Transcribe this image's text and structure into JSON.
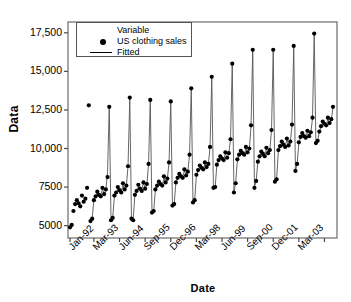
{
  "chart_data": {
    "type": "scatter",
    "title": "",
    "xlabel": "Date",
    "ylabel": "Data",
    "grid": false,
    "ylim": [
      4200,
      18200
    ],
    "yticks": [
      5000,
      7500,
      10000,
      12500,
      15000,
      17500
    ],
    "ytick_labels": [
      "5000",
      "7500",
      "10,000",
      "12,500",
      "15,000",
      "17,500"
    ],
    "xtick_labels": [
      "Jan-92",
      "Mar-93",
      "Jun-94",
      "Sep-95",
      "Dec-96",
      "Mar-98",
      "Jun-99",
      "Sep-00",
      "Dec-01",
      "Mar-03"
    ],
    "xtick_indices": [
      0,
      14,
      29,
      44,
      59,
      74,
      89,
      104,
      119,
      134
    ],
    "xtick_unlabeled_indices": [
      149
    ],
    "legend": {
      "position": "top-left-inside",
      "title": "Variable",
      "entries": [
        {
          "name": "US clothing sales",
          "marker": "filled-circle",
          "color": "#000000"
        },
        {
          "name": "Fitted",
          "marker": "line",
          "color": "#000000"
        }
      ]
    },
    "x_start": "Jan-92",
    "x_frequency": "monthly",
    "series": [
      {
        "name": "US clothing sales",
        "marker": "filled-circle",
        "color": "#000000",
        "values": [
          4889,
          5050,
          5950,
          6400,
          6650,
          6450,
          6250,
          6950,
          6550,
          6750,
          7450,
          12800,
          5300,
          5450,
          6650,
          6900,
          7200,
          7000,
          6900,
          7450,
          7050,
          7350,
          8150,
          12700,
          5350,
          5500,
          6950,
          7150,
          7500,
          7300,
          7150,
          7750,
          7350,
          7600,
          8850,
          13300,
          5450,
          5350,
          7000,
          7250,
          7650,
          7400,
          7250,
          7800,
          7400,
          7700,
          9000,
          13150,
          5850,
          5950,
          7350,
          7600,
          7850,
          7700,
          7600,
          8200,
          7800,
          8050,
          9100,
          13050,
          6300,
          6400,
          7800,
          8100,
          8350,
          8200,
          8100,
          8650,
          8250,
          8500,
          9600,
          13900,
          6500,
          6650,
          8300,
          8600,
          8900,
          8750,
          8650,
          9100,
          8800,
          9000,
          10100,
          14650,
          7450,
          7500,
          8950,
          9250,
          9500,
          9350,
          9250,
          9750,
          9400,
          9700,
          10600,
          15500,
          7150,
          7750,
          9300,
          9600,
          9850,
          9700,
          9600,
          10100,
          9750,
          10000,
          11500,
          16400,
          7450,
          7900,
          9150,
          9500,
          9800,
          9650,
          9500,
          10050,
          9700,
          9900,
          11200,
          16400,
          7850,
          8000,
          9900,
          10150,
          10450,
          10250,
          10100,
          10650,
          10200,
          10450,
          11550,
          16650,
          8550,
          9000,
          10400,
          10750,
          11000,
          10800,
          10700,
          11150,
          10800,
          11050,
          12000,
          17450,
          10350,
          10500,
          11100,
          11450,
          11750,
          11600,
          11500,
          12000,
          11650,
          11900,
          12700
        ]
      },
      {
        "name": "Fitted",
        "marker": "line",
        "color": "#000000",
        "values": [
          null,
          null,
          null,
          null,
          null,
          null,
          null,
          null,
          null,
          null,
          null,
          null,
          5300,
          5500,
          6700,
          6900,
          7150,
          7000,
          6900,
          7400,
          7050,
          7300,
          8500,
          12750,
          5400,
          5500,
          6900,
          7100,
          7400,
          7250,
          7150,
          7650,
          7300,
          7550,
          8900,
          13250,
          5400,
          5400,
          7000,
          7200,
          7550,
          7400,
          7300,
          7800,
          7400,
          7650,
          9000,
          13100,
          5900,
          5950,
          7300,
          7550,
          7800,
          7650,
          7550,
          8100,
          7750,
          8000,
          9100,
          13000,
          6300,
          6400,
          7800,
          8050,
          8350,
          8200,
          8100,
          8600,
          8250,
          8500,
          9600,
          13850,
          6550,
          6650,
          8250,
          8550,
          8850,
          8700,
          8600,
          9050,
          8750,
          8950,
          10100,
          14600,
          7400,
          7500,
          8950,
          9200,
          9500,
          9350,
          9250,
          9700,
          9400,
          9650,
          10600,
          15450,
          7200,
          7750,
          9250,
          9550,
          9800,
          9650,
          9550,
          10050,
          9700,
          9950,
          11450,
          16350,
          7500,
          7900,
          9150,
          9450,
          9750,
          9600,
          9500,
          10000,
          9700,
          9900,
          11200,
          16350,
          7850,
          8000,
          9850,
          10100,
          10400,
          10250,
          10100,
          10600,
          10200,
          10400,
          11500,
          16600,
          8550,
          9000,
          10350,
          10700,
          10950,
          10800,
          10700,
          11100,
          10800,
          11000,
          11950,
          17400,
          10300,
          10450,
          11100,
          11400,
          11700,
          11550,
          11450,
          11950,
          11600,
          11850,
          12650
        ]
      }
    ]
  }
}
